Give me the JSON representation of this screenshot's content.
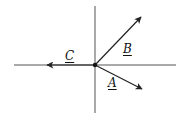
{
  "diagram": {
    "title": "",
    "origin": {
      "x": 95,
      "y": 65
    },
    "axes": {
      "horizontal": {
        "x1": 14,
        "y1": 65,
        "x2": 176,
        "y2": 65
      },
      "vertical": {
        "x1": 95,
        "y1": 6,
        "x2": 95,
        "y2": 113
      }
    },
    "vectors": [
      {
        "name": "A",
        "label": "A",
        "to": {
          "x": 142,
          "y": 89
        }
      },
      {
        "name": "B",
        "label": "B",
        "to": {
          "x": 141,
          "y": 17
        }
      },
      {
        "name": "C",
        "label": "C",
        "to": {
          "x": 47,
          "y": 65
        }
      }
    ],
    "colors": {
      "line": "#222222",
      "axis": "#555555"
    }
  }
}
